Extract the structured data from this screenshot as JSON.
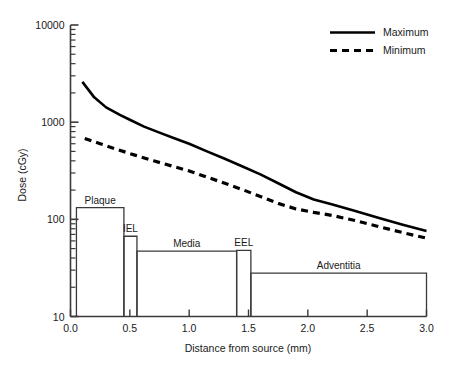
{
  "chart_data": {
    "type": "line",
    "title": "",
    "xlabel": "Distance from source (mm)",
    "ylabel": "Dose (cGy)",
    "xlim": [
      0.0,
      3.0
    ],
    "ylim": [
      10,
      10000
    ],
    "yscale": "log",
    "grid": false,
    "legend_position": "top-right",
    "xticks": [
      0.0,
      0.5,
      1.0,
      1.5,
      2.0,
      2.5,
      3.0
    ],
    "xtick_labels": [
      "0.0",
      "0.5",
      "1.0",
      "1.5",
      "2.0",
      "2.5",
      "3.0"
    ],
    "yticks": [
      10,
      100,
      1000,
      10000
    ],
    "ytick_labels": [
      "10",
      "100",
      "1000",
      "10000"
    ],
    "series": [
      {
        "name": "Maximum",
        "style": "solid",
        "color": "#000000",
        "x": [
          0.1,
          0.2,
          0.3,
          0.42,
          0.5,
          0.62,
          0.75,
          0.88,
          1.0,
          1.15,
          1.3,
          1.45,
          1.6,
          1.75,
          1.9,
          2.05,
          2.2,
          2.4,
          2.6,
          2.8,
          3.0
        ],
        "y": [
          2600,
          1800,
          1420,
          1180,
          1060,
          900,
          780,
          680,
          600,
          500,
          420,
          350,
          290,
          235,
          190,
          160,
          143,
          122,
          103,
          88,
          76
        ]
      },
      {
        "name": "Minimum",
        "style": "dashed",
        "color": "#000000",
        "x": [
          0.12,
          0.25,
          0.4,
          0.55,
          0.7,
          0.85,
          1.0,
          1.15,
          1.3,
          1.45,
          1.6,
          1.75,
          1.9,
          2.05,
          2.2,
          2.4,
          2.6,
          2.8,
          3.0
        ],
        "y": [
          680,
          600,
          520,
          455,
          400,
          355,
          315,
          272,
          235,
          202,
          172,
          146,
          128,
          118,
          110,
          97,
          84,
          73,
          64
        ]
      }
    ],
    "layers": [
      {
        "name": "Plaque",
        "x_start": 0.05,
        "x_end": 0.45,
        "height": 132,
        "label_above": true
      },
      {
        "name": "IEL",
        "x_start": 0.45,
        "x_end": 0.56,
        "height": 67,
        "label_above": true
      },
      {
        "name": "Media",
        "x_start": 0.56,
        "x_end": 1.4,
        "height": 47,
        "label_above": true
      },
      {
        "name": "EEL",
        "x_start": 1.4,
        "x_end": 1.52,
        "height": 48,
        "label_above": true
      },
      {
        "name": "Adventitia",
        "x_start": 1.52,
        "x_end": 3.0,
        "height": 28,
        "label_above": true
      }
    ],
    "layer_baseline": 10
  },
  "legend": {
    "entries": [
      {
        "label": "Maximum",
        "style": "solid"
      },
      {
        "label": "Minimum",
        "style": "dashed"
      }
    ]
  },
  "axes": {
    "x_title": "Distance from source (mm)",
    "y_title": "Dose (cGy)"
  }
}
